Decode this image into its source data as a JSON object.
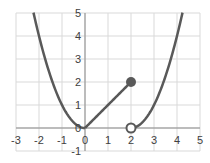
{
  "chart_data": {
    "type": "line",
    "title": "",
    "xlabel": "",
    "ylabel": "",
    "xlim": [
      -3,
      5
    ],
    "ylim": [
      -1,
      5
    ],
    "grid": true,
    "legend": null,
    "x_ticks": [
      "-3",
      "-2",
      "-1",
      "0",
      "1",
      "2",
      "3",
      "4",
      "5"
    ],
    "y_ticks": [
      "-1",
      "0",
      "1",
      "2",
      "3",
      "4",
      "5"
    ],
    "series": [
      {
        "name": "left-parabola",
        "function": "y = x^2",
        "domain": [
          -2.24,
          0
        ],
        "points": [
          [
            -2.2,
            4.84
          ],
          [
            -2,
            4
          ],
          [
            -1.5,
            2.25
          ],
          [
            -1,
            1
          ],
          [
            -0.5,
            0.25
          ],
          [
            0,
            0
          ]
        ]
      },
      {
        "name": "line-segment",
        "function": "y = x",
        "domain": [
          0,
          2
        ],
        "points": [
          [
            0,
            0
          ],
          [
            2,
            2
          ]
        ]
      },
      {
        "name": "right-parabola",
        "function": "y = (x-2)^2",
        "domain": [
          2,
          4.24
        ],
        "points": [
          [
            2,
            0
          ],
          [
            2.5,
            0.25
          ],
          [
            3,
            1
          ],
          [
            3.5,
            2.25
          ],
          [
            4,
            4
          ],
          [
            4.24,
            5
          ]
        ]
      }
    ],
    "markers": [
      {
        "x": 2,
        "y": 2,
        "style": "filled",
        "label": "closed endpoint"
      },
      {
        "x": 2,
        "y": 0,
        "style": "open",
        "label": "open endpoint"
      }
    ],
    "colors": {
      "curve": "#595959",
      "grid": "#d9d9d9",
      "axis": "#a6a6a6",
      "text": "#404040"
    }
  }
}
